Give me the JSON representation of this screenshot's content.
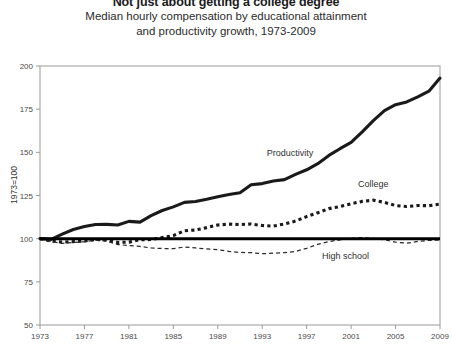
{
  "header": {
    "title": "Not just about getting a college degree",
    "subtitle_line1": "Median hourly compensation by educational attainment",
    "subtitle_line2": "and productivity growth, 1973-2009"
  },
  "chart_data": {
    "type": "line",
    "title": "Not just about getting a college degree",
    "subtitle": "Median hourly compensation by educational attainment and productivity growth, 1973-2009",
    "xlabel": "",
    "ylabel": "1973=100",
    "xlim": [
      1973,
      2009
    ],
    "ylim": [
      50,
      200
    ],
    "yticks": [
      50,
      75,
      100,
      125,
      150,
      175,
      200
    ],
    "xticks": [
      1973,
      1977,
      1981,
      1985,
      1989,
      1993,
      1997,
      2001,
      2005,
      2009
    ],
    "grid": false,
    "legend_position": "inline-annotations",
    "reference_line": 100,
    "x": [
      1973,
      1974,
      1975,
      1976,
      1977,
      1978,
      1979,
      1980,
      1981,
      1982,
      1983,
      1984,
      1985,
      1986,
      1987,
      1988,
      1989,
      1990,
      1991,
      1992,
      1993,
      1994,
      1995,
      1996,
      1997,
      1998,
      1999,
      2000,
      2001,
      2002,
      2003,
      2004,
      2005,
      2006,
      2007,
      2008,
      2009
    ],
    "series": [
      {
        "name": "Productivity",
        "style": "solid-thick",
        "values": [
          100.0,
          99.6,
          102.6,
          105.3,
          107.0,
          108.2,
          108.3,
          107.9,
          110.0,
          109.6,
          113.3,
          116.3,
          118.4,
          121.0,
          121.5,
          122.8,
          124.3,
          125.6,
          126.6,
          131.2,
          131.9,
          133.4,
          134.2,
          137.2,
          139.9,
          143.4,
          148.2,
          152.1,
          155.8,
          161.9,
          168.4,
          174.2,
          177.6,
          179.2,
          182.1,
          185.4,
          193.0
        ]
      },
      {
        "name": "College",
        "style": "dotted-thick",
        "values": [
          100.0,
          98.6,
          98.0,
          98.3,
          98.6,
          99.6,
          99.2,
          97.8,
          98.0,
          99.4,
          99.5,
          100.6,
          101.8,
          104.6,
          105.0,
          106.4,
          107.9,
          108.4,
          108.2,
          108.5,
          107.6,
          107.3,
          108.5,
          110.2,
          112.8,
          115.0,
          117.4,
          118.6,
          120.2,
          121.6,
          122.3,
          121.0,
          119.2,
          118.6,
          119.2,
          119.1,
          120.0
        ]
      },
      {
        "name": "High school",
        "style": "dashed-thin",
        "values": [
          100.0,
          98.4,
          97.3,
          97.8,
          98.2,
          99.1,
          98.6,
          96.6,
          96.0,
          95.5,
          94.6,
          94.3,
          94.2,
          95.2,
          94.6,
          94.1,
          93.6,
          92.6,
          92.0,
          91.9,
          91.3,
          91.6,
          91.9,
          92.6,
          94.4,
          96.7,
          98.3,
          99.3,
          100.2,
          100.6,
          100.2,
          99.3,
          98.0,
          97.4,
          98.4,
          99.0,
          99.2
        ]
      }
    ],
    "annotations": [
      {
        "text": "Productivity",
        "x": 1995.5,
        "y": 148
      },
      {
        "text": "College",
        "x": 2003.0,
        "y": 130
      },
      {
        "text": "High school",
        "x": 2000.5,
        "y": 88
      }
    ]
  }
}
